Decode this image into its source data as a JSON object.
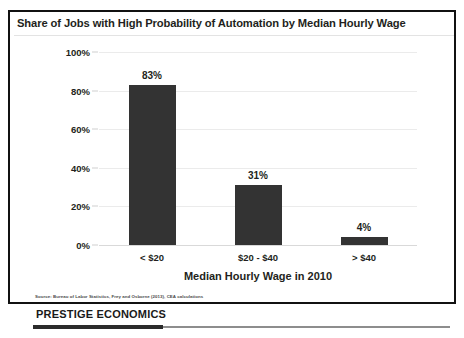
{
  "chart_data": {
    "type": "bar",
    "title": "Share of Jobs with High Probability of Automation by Median Hourly Wage",
    "categories": [
      "< $20",
      "$20 - $40",
      "> $40"
    ],
    "values": [
      83,
      31,
      4
    ],
    "value_labels": [
      "83%",
      "31%",
      "4%"
    ],
    "xlabel": "Median Hourly Wage in 2010",
    "ylabel": "",
    "ylim": [
      0,
      100
    ],
    "yticks": [
      0,
      20,
      40,
      60,
      80,
      100
    ],
    "ytick_labels": [
      "0%",
      "20%",
      "40%",
      "60%",
      "80%",
      "100%"
    ],
    "grid": true,
    "legend": "none",
    "bar_color": "#333333",
    "source_note": "Source: Bureau of Labor Statistics, Frey and Osborne (2013), CEA calculations"
  },
  "footer": {
    "brand": "PRESTIGE ECONOMICS"
  }
}
